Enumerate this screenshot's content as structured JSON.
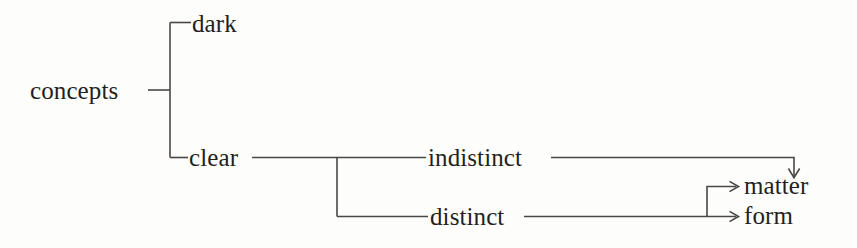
{
  "diagram": {
    "type": "tree-diagram",
    "title": "",
    "stroke_color": "#4a4744",
    "text_color": "#231f1e",
    "background_color": "#fdfdfc",
    "nodes": {
      "root": "concepts",
      "dark": "dark",
      "clear": "clear",
      "indistinct": "indistinct",
      "distinct": "distinct",
      "matter": "matter",
      "form": "form"
    },
    "edges": [
      {
        "from": "concepts",
        "to": "dark",
        "arrow": false
      },
      {
        "from": "concepts",
        "to": "clear",
        "arrow": false
      },
      {
        "from": "clear",
        "to": "indistinct",
        "arrow": false
      },
      {
        "from": "clear",
        "to": "distinct",
        "arrow": false
      },
      {
        "from": "indistinct",
        "to": "matter",
        "arrow": true
      },
      {
        "from": "distinct",
        "to": "matter",
        "arrow": true
      },
      {
        "from": "distinct",
        "to": "form",
        "arrow": true
      }
    ]
  }
}
